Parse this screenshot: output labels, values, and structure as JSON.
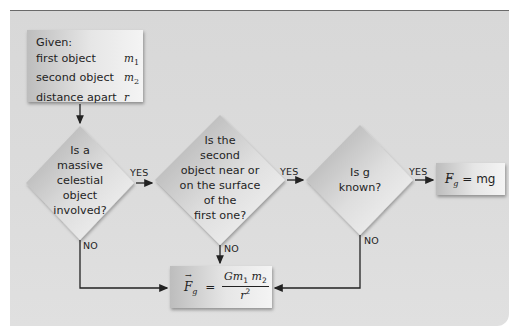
{
  "diagram": {
    "type": "flowchart",
    "given_box": {
      "title": "Given:",
      "rows": [
        {
          "label": "first object",
          "symbol": "m",
          "sub": "1"
        },
        {
          "label": "second object",
          "symbol": "m",
          "sub": "2"
        },
        {
          "label": "distance apart",
          "symbol": "r",
          "sub": ""
        }
      ]
    },
    "decisions": [
      {
        "lines": [
          "Is a",
          "massive",
          "celestial",
          "object",
          "involved?"
        ],
        "yes_label": "YES",
        "no_label": "NO"
      },
      {
        "lines": [
          "Is the",
          "second",
          "object near or",
          "on the surface",
          "of the",
          "first one?"
        ],
        "yes_label": "YES",
        "no_label": "NO"
      },
      {
        "lines": [
          "Is g",
          "known?"
        ],
        "yes_label": "YES",
        "no_label": "NO"
      }
    ],
    "result_simple": {
      "lhs": "F",
      "lhs_sub": "g",
      "equals": "=",
      "rhs": "mg"
    },
    "result_general": {
      "lhs": "F",
      "lhs_sub": "g",
      "equals": "=",
      "numerator": "Gm",
      "n_sub1": "1",
      "n_m2": "m",
      "n_sub2": "2",
      "denominator": "r",
      "den_sup": "2"
    },
    "colors": {
      "panel_bg": "#dadada",
      "panel_border": "#6a6a6a",
      "arrow": "#222222"
    }
  }
}
